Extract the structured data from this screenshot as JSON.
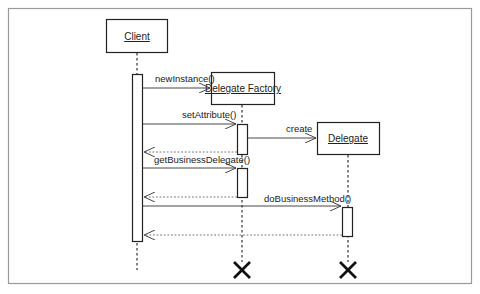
{
  "diagram": {
    "type": "sequence",
    "participants": [
      {
        "id": "client",
        "label": "Client"
      },
      {
        "id": "factory",
        "label": "Delegate Factory"
      },
      {
        "id": "delegate",
        "label": "Delegate"
      }
    ],
    "messages": [
      {
        "from": "client",
        "to": "factory",
        "label": "newInstance()",
        "kind": "create"
      },
      {
        "from": "client",
        "to": "factory",
        "label": "setAttribute()",
        "kind": "call"
      },
      {
        "from": "factory",
        "to": "delegate",
        "label": "create",
        "kind": "create"
      },
      {
        "from": "factory",
        "to": "client",
        "label": "",
        "kind": "return"
      },
      {
        "from": "client",
        "to": "factory",
        "label": "getBusinessDelegate()",
        "kind": "call"
      },
      {
        "from": "factory",
        "to": "client",
        "label": "",
        "kind": "return"
      },
      {
        "from": "client",
        "to": "delegate",
        "label": "doBusinessMethod()",
        "kind": "call"
      },
      {
        "from": "delegate",
        "to": "client",
        "label": "",
        "kind": "return"
      }
    ],
    "destroyed": [
      "factory",
      "delegate"
    ],
    "colors": {
      "line": "#222222",
      "dashed": "#555555",
      "frame": "#9a9a9a"
    }
  }
}
